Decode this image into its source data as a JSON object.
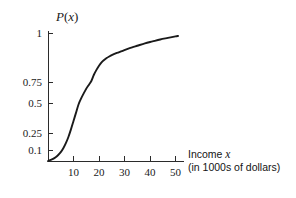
{
  "chart_data": {
    "type": "line",
    "title": "",
    "subtitle": "",
    "xlabel": "Income x",
    "xlabel_sub": "(in 1000s of dollars)",
    "ylabel": "P(x)",
    "xlim": [
      0,
      53
    ],
    "ylim": [
      0,
      1.03
    ],
    "grid": false,
    "legend": null,
    "x_ticks": [
      {
        "value": 10,
        "label": "10"
      },
      {
        "value": 20,
        "label": "20"
      },
      {
        "value": 30,
        "label": "30"
      },
      {
        "value": 40,
        "label": "40"
      },
      {
        "value": 50,
        "label": "50"
      }
    ],
    "y_ticks": [
      {
        "value": 0.1,
        "label": "0.1"
      },
      {
        "value": 0.25,
        "label": "0.25"
      },
      {
        "value": 0.5,
        "label": "0.5"
      },
      {
        "value": 0.75,
        "label": "0.75"
      },
      {
        "value": 1,
        "label": "1"
      }
    ],
    "series": [
      {
        "name": "P(x)",
        "color": "#1a1a1a",
        "x": [
          0,
          1,
          2,
          3,
          4,
          5,
          6,
          7,
          8,
          9,
          10,
          11,
          12,
          13,
          14,
          15,
          16,
          17,
          18,
          19,
          20,
          21,
          22,
          23,
          24,
          25,
          27,
          29,
          31,
          33,
          35,
          38,
          41,
          44,
          47,
          50,
          51
        ],
        "values": [
          0.0,
          0.01,
          0.02,
          0.035,
          0.055,
          0.08,
          0.115,
          0.16,
          0.215,
          0.28,
          0.35,
          0.42,
          0.49,
          0.555,
          0.615,
          0.67,
          0.715,
          0.755,
          0.787,
          0.812,
          0.833,
          0.85,
          0.862,
          0.872,
          0.88,
          0.887,
          0.898,
          0.908,
          0.918,
          0.927,
          0.935,
          0.947,
          0.957,
          0.967,
          0.975,
          0.983,
          0.985
        ]
      }
    ]
  },
  "axes_geometry": {
    "origin_x_px": 48,
    "origin_y_px": 161,
    "x_axis_end_px": 184,
    "y_axis_top_px": 31,
    "px_per_x_unit": 2.55,
    "y_tick_px": {
      "0.1": 150,
      "0.25": 133,
      "0.5": 103,
      "0.75": 82,
      "1": 33
    }
  },
  "colors": {
    "background": "#ffffff",
    "ink": "#1a1a1a",
    "axis": "#2b2b2b"
  }
}
